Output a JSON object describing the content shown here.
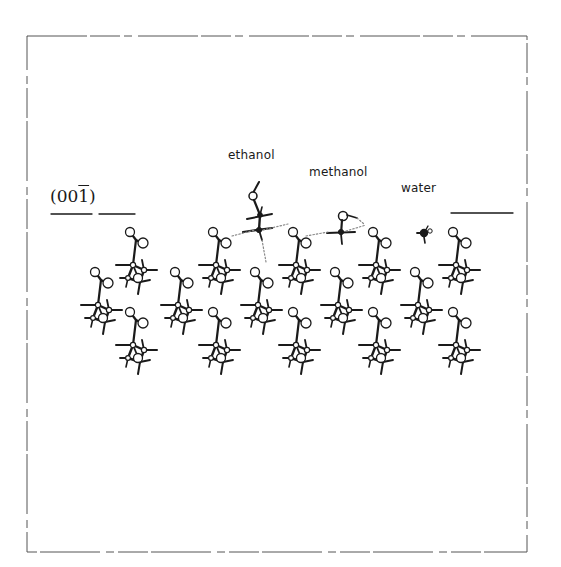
{
  "figure": {
    "frame": {
      "x": 27,
      "y": 36,
      "width": 500,
      "height": 516,
      "color": "#555555"
    },
    "plane_label": {
      "prefix": "(00",
      "barred_index": "1",
      "suffix": ")"
    },
    "surface_lines": [
      {
        "x1": 51,
        "x2": 92,
        "y": 214
      },
      {
        "x1": 99,
        "x2": 135,
        "y": 214
      },
      {
        "x1": 451,
        "x2": 513,
        "y": 213
      }
    ],
    "labels": {
      "ethanol": "ethanol",
      "methanol": "methanol",
      "water": "water"
    },
    "host_molecules": {
      "rows": [
        {
          "name": "row-a",
          "y": 232,
          "x": [
            130,
            213,
            293,
            373,
            453
          ]
        },
        {
          "name": "row-b",
          "y": 272,
          "x": [
            95,
            175,
            255,
            335,
            415
          ]
        },
        {
          "name": "row-c",
          "y": 312,
          "x": [
            130,
            213,
            293,
            373,
            453
          ]
        }
      ]
    },
    "solvents": [
      {
        "name": "ethanol",
        "x": 258,
        "y": 182
      },
      {
        "name": "methanol",
        "x": 345,
        "y": 215
      },
      {
        "name": "water",
        "x": 425,
        "y": 232
      }
    ],
    "colors": {
      "ink": "#1a1a1a",
      "hbond": "#888888"
    }
  }
}
